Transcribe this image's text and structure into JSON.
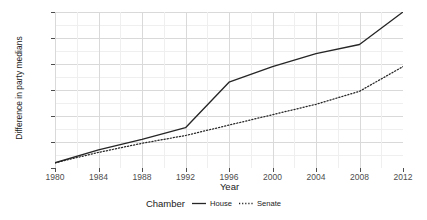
{
  "chart_data": {
    "type": "line",
    "title": "",
    "xlabel": "Year",
    "ylabel": "Difference in party medians",
    "x": [
      1980,
      1984,
      1988,
      1992,
      1996,
      2000,
      2004,
      2008,
      2012
    ],
    "xlim": [
      1980,
      2012
    ],
    "ylim": [
      0.5,
      1.1
    ],
    "xticks": [
      "1980",
      "1984",
      "1988",
      "1992",
      "1996",
      "2000",
      "2004",
      "2008",
      "2012"
    ],
    "yticks": [
      "0.5",
      "0.6",
      "0.7",
      "0.8",
      "0.9",
      "1.0",
      "1.1"
    ],
    "grid": true,
    "legend_position": "bottom",
    "legend_title": "Chamber",
    "series": [
      {
        "name": "House",
        "style": "solid",
        "color": "#262626",
        "values": [
          0.52,
          0.57,
          0.61,
          0.655,
          0.83,
          0.89,
          0.94,
          0.975,
          1.1
        ]
      },
      {
        "name": "Senate",
        "style": "dotted",
        "color": "#262626",
        "values": [
          0.52,
          0.56,
          0.595,
          0.625,
          0.665,
          0.705,
          0.745,
          0.795,
          0.89
        ]
      }
    ]
  },
  "axis": {
    "y_title": "Difference in party medians",
    "x_title": "Year"
  },
  "legend": {
    "title": "Chamber",
    "items": [
      {
        "label": "House",
        "style": "solid"
      },
      {
        "label": "Senate",
        "style": "dotted"
      }
    ]
  }
}
